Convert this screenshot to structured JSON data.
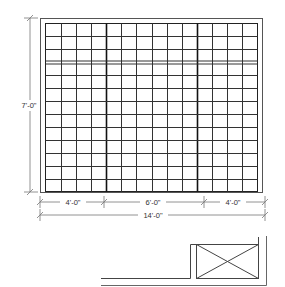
{
  "diagram": {
    "type": "elevation",
    "colors": {
      "line": "#222222",
      "dim_line": "#777777",
      "text": "#333333",
      "background": "#ffffff"
    },
    "panel": {
      "columns_per_section": [
        4,
        6,
        4
      ],
      "rows_top_band": 3,
      "rows_bottom_band": 10
    },
    "dimensions": {
      "height": "7'-0\"",
      "section_left": "4'-0\"",
      "section_middle": "6'-0\"",
      "section_right": "4'-0\"",
      "overall_width": "14'-0\""
    },
    "plan": {
      "fixture": "box with X (cabinet/unit in plan)"
    }
  }
}
